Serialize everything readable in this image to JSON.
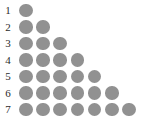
{
  "figure": {
    "title": "",
    "background_color": "#ffffff",
    "dot_color": "#919191",
    "label_color": "#2b2b2b",
    "row_labels": [
      "1",
      "2",
      "3",
      "4",
      "5",
      "6",
      "7"
    ]
  },
  "chart_data": {
    "type": "bar",
    "title": "",
    "subtitle": "",
    "xlabel": "",
    "ylabel": "",
    "categories": [
      "1",
      "2",
      "3",
      "4",
      "5",
      "6",
      "7"
    ],
    "values": [
      1,
      2,
      3,
      4,
      5,
      6,
      7
    ],
    "value_labels": [
      "1",
      "2",
      "3",
      "4",
      "5",
      "6",
      "7"
    ],
    "orientation": "horizontal",
    "glyph": "circle",
    "glyph_color": "#919191",
    "grid": false,
    "legend": null,
    "xlim": [
      0,
      7
    ],
    "ylim": [
      1,
      7
    ],
    "annotations": []
  }
}
